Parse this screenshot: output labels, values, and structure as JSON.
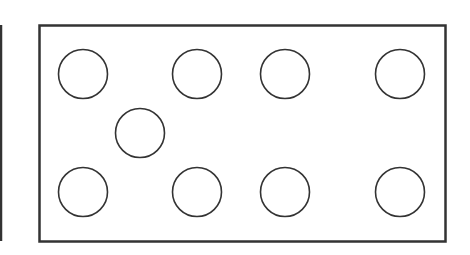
{
  "diagram": {
    "background": "#ffffff",
    "stroke_color": "#333333",
    "left_edge_line": {
      "x": 1,
      "y1": 25,
      "y2": 241
    },
    "frame": {
      "x": 39.5,
      "y": 25.5,
      "width": 406,
      "height": 216
    },
    "circle_radius": 24.5,
    "circles": [
      {
        "cx": 83,
        "cy": 74
      },
      {
        "cx": 197,
        "cy": 74
      },
      {
        "cx": 285,
        "cy": 74
      },
      {
        "cx": 400,
        "cy": 74
      },
      {
        "cx": 140,
        "cy": 133
      },
      {
        "cx": 83,
        "cy": 192
      },
      {
        "cx": 197,
        "cy": 192
      },
      {
        "cx": 285,
        "cy": 192
      },
      {
        "cx": 400,
        "cy": 192
      }
    ]
  }
}
